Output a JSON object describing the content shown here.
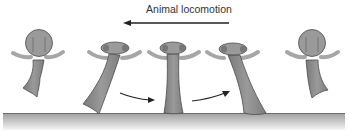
{
  "title": "Animal locomotion",
  "direction": "left",
  "colors": {
    "bone_fill": "#8c8c8c",
    "bone_outline": "#4d4d4d",
    "bone_head": "#9a9a9a",
    "arc": "#a6a6a6",
    "arrow": "#222222",
    "ground_top": "#9e9e9e",
    "ground_bottom": "#f4f4f4",
    "text": "#333333"
  },
  "figures": [
    {
      "id": 1,
      "phase": "swing-retracted",
      "x": 36
    },
    {
      "id": 2,
      "phase": "touchdown",
      "x": 121
    },
    {
      "id": 3,
      "phase": "midstance",
      "x": 173
    },
    {
      "id": 4,
      "phase": "push-off",
      "x": 237
    },
    {
      "id": 5,
      "phase": "swing-retracted",
      "x": 310
    }
  ],
  "transition_arrows": [
    {
      "from": 2,
      "to": 3
    },
    {
      "from": 3,
      "to": 4
    }
  ]
}
